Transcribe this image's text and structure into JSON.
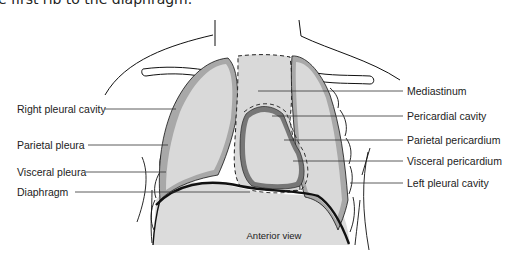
{
  "header": {
    "cropped_text": "e first rib to the diaphragm."
  },
  "diagram": {
    "caption": "Anterior view",
    "colors": {
      "cavity_fill": "#d9d9d9",
      "pleura_band": "#a8a8a8",
      "pericardium_band": "#777777",
      "outline": "#111111",
      "leader_line": "#333333"
    },
    "labels_left": [
      {
        "text": "Right pleural cavity",
        "y": 103
      },
      {
        "text": "Parietal pleura",
        "y": 139
      },
      {
        "text": "Visceral pleura",
        "y": 166
      },
      {
        "text": "Diaphragm",
        "y": 186
      }
    ],
    "labels_right": [
      {
        "text": "Mediastinum",
        "y": 85
      },
      {
        "text": "Pericardial cavity",
        "y": 110
      },
      {
        "text": "Parietal pericardium",
        "y": 134
      },
      {
        "text": "Visceral pericardium",
        "y": 155
      },
      {
        "text": "Left pleural cavity",
        "y": 177
      }
    ]
  }
}
